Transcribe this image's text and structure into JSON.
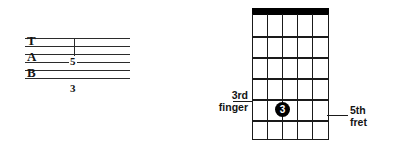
{
  "figure": {
    "kind": "guitar-tab-and-chord-diagram",
    "colors": {
      "ink": "#1a1a1a",
      "nut": "#000000",
      "dot_fill": "#000000",
      "dot_text": "#ffffff",
      "background": "#ffffff"
    }
  },
  "tab": {
    "clef_letters": [
      "T",
      "A",
      "B"
    ],
    "line_count": 6,
    "fret_number": "5",
    "finger_number": "3",
    "note_string_index": 3,
    "stem": true
  },
  "chord_diagram": {
    "string_count": 6,
    "fret_count": 6,
    "nut": true,
    "dots": [
      {
        "label": "3",
        "string": 2,
        "fret": 5
      }
    ],
    "annotations": {
      "left": {
        "line1": "3rd",
        "line2": "finger"
      },
      "right": {
        "line1": "5th",
        "line2": "fret"
      }
    }
  }
}
